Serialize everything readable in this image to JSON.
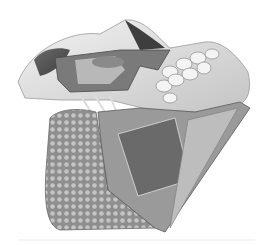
{
  "image": {
    "subject": "Anatomical illustration of skull lateral view showing maxillary sinus, teeth, and dissected jaw region",
    "palette": {
      "background": "#ffffff",
      "bone_light": "#e8e8e8",
      "bone_mid": "#c8c8c8",
      "shadow": "#4a4a4a",
      "tissue_dark": "#5a5a5a",
      "stipple": "#9a9a9a",
      "outline": "#6a6a6a"
    }
  }
}
